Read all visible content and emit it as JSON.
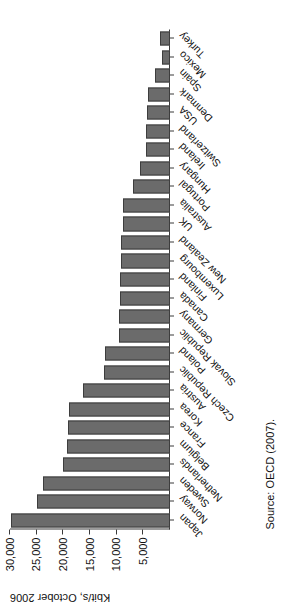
{
  "chart_data": {
    "type": "bar",
    "title": "",
    "subtitle": "",
    "xlabel": "",
    "ylabel": "Kbit/s, October 2006",
    "ylim": [
      0,
      30000
    ],
    "yticks": [
      0,
      5000,
      10000,
      15000,
      20000,
      25000,
      30000
    ],
    "ytick_labels": [
      "",
      "5,000",
      "10,000",
      "15,000",
      "20,000",
      "25,000",
      "30,000"
    ],
    "grid": false,
    "legend": "none",
    "orientation": "vertical-bars-rotated-page",
    "bar_color": "#6b6b6b",
    "bar_edge_color": "#3d3d3d",
    "categories": [
      "Japan",
      "Norway",
      "Sweden",
      "Netherlands",
      "Belgium",
      "France",
      "Korea",
      "Austria",
      "Czech Republic",
      "Poland",
      "Slovak Republic",
      "Germany",
      "Canada",
      "Finland",
      "Luxembourg",
      "New Zealand",
      "UK",
      "Australia",
      "Portugal",
      "Hungary",
      "Ireland",
      "Switzerland",
      "USA",
      "Denmark",
      "Spain",
      "Mexico",
      "Turkey"
    ],
    "values": [
      29800,
      24900,
      23900,
      20100,
      19300,
      19200,
      19000,
      16300,
      12400,
      12100,
      9600,
      9500,
      9400,
      9300,
      9200,
      9100,
      8900,
      8800,
      7000,
      5600,
      4500,
      4500,
      4400,
      4200,
      2800,
      1500,
      1800
    ],
    "source": "Source: OECD (2007)."
  },
  "figure": {
    "axis_title": "Kbit/s, October 2006",
    "source": "Source: OECD (2007)."
  }
}
